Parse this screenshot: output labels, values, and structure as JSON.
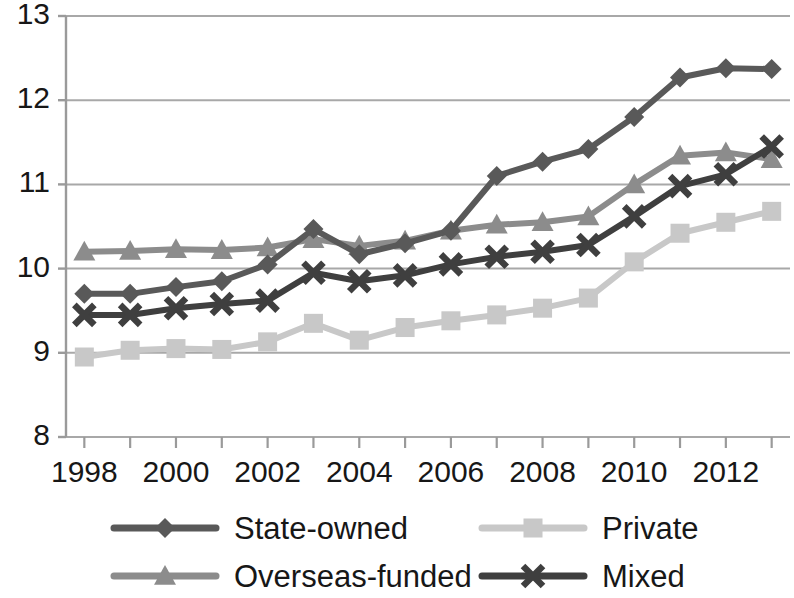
{
  "chart_data": {
    "type": "line",
    "title": "",
    "subtitle": "",
    "xlabel": "",
    "ylabel": "",
    "x": [
      1998,
      1999,
      2000,
      2001,
      2002,
      2003,
      2004,
      2005,
      2006,
      2007,
      2008,
      2009,
      2010,
      2011,
      2012,
      2013
    ],
    "xlim": [
      1997.6,
      2013.4
    ],
    "ylim": [
      8,
      13
    ],
    "xticks": [
      1998,
      1999,
      2000,
      2001,
      2002,
      2003,
      2004,
      2005,
      2006,
      2007,
      2008,
      2009,
      2010,
      2011,
      2012,
      2013
    ],
    "xtick_labels": [
      "1998",
      "",
      "2000",
      "",
      "2002",
      "",
      "2004",
      "",
      "2006",
      "",
      "2008",
      "",
      "2010",
      "",
      "2012",
      ""
    ],
    "yticks": [
      8,
      9,
      10,
      11,
      12,
      13
    ],
    "ytick_labels": [
      "8",
      "9",
      "10",
      "11",
      "12",
      "13"
    ],
    "grid": "horizontal",
    "legend_position": "bottom",
    "series": [
      {
        "name": "State-owned",
        "marker": "diamond",
        "color": "#595959",
        "values": [
          9.7,
          9.7,
          9.78,
          9.85,
          10.05,
          10.47,
          10.17,
          10.3,
          10.45,
          11.1,
          11.27,
          11.42,
          11.8,
          12.27,
          12.38,
          12.37
        ]
      },
      {
        "name": "Private",
        "marker": "square",
        "color": "#c8c8c8",
        "values": [
          8.95,
          9.03,
          9.05,
          9.04,
          9.13,
          9.35,
          9.15,
          9.3,
          9.38,
          9.45,
          9.53,
          9.65,
          10.08,
          10.42,
          10.55,
          10.68
        ]
      },
      {
        "name": "Overseas-funded",
        "marker": "triangle",
        "color": "#8c8c8c",
        "values": [
          10.2,
          10.21,
          10.23,
          10.22,
          10.25,
          10.35,
          10.27,
          10.33,
          10.45,
          10.52,
          10.55,
          10.62,
          11.0,
          11.34,
          11.38,
          11.3
        ]
      },
      {
        "name": "Mixed",
        "marker": "x",
        "color": "#3f3f3f",
        "values": [
          9.45,
          9.45,
          9.53,
          9.58,
          9.62,
          9.95,
          9.85,
          9.92,
          10.05,
          10.14,
          10.2,
          10.28,
          10.62,
          10.98,
          11.12,
          11.45
        ]
      }
    ],
    "axis_color": "#9a9a9a",
    "grid_color": "#a8a8a8",
    "text_color": "#171717",
    "background": "#ffffff"
  },
  "legend": {
    "items": [
      {
        "label": "State-owned"
      },
      {
        "label": "Private"
      },
      {
        "label": "Overseas-funded"
      },
      {
        "label": "Mixed"
      }
    ]
  }
}
